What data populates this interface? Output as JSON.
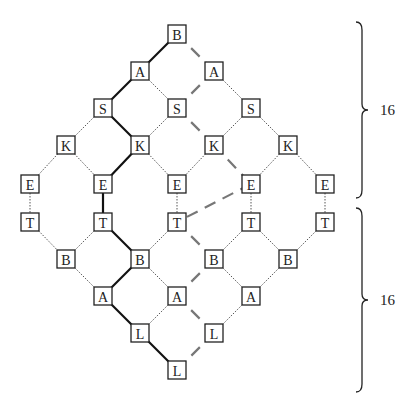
{
  "title": "",
  "node_size": 18,
  "nodes": [
    {
      "id": "n0",
      "label": "B",
      "x": 177,
      "y": 34
    },
    {
      "id": "n1",
      "label": "A",
      "x": 140,
      "y": 71
    },
    {
      "id": "n2",
      "label": "A",
      "x": 214,
      "y": 71
    },
    {
      "id": "n3",
      "label": "S",
      "x": 103,
      "y": 108
    },
    {
      "id": "n4",
      "label": "S",
      "x": 177,
      "y": 108
    },
    {
      "id": "n5",
      "label": "S",
      "x": 251,
      "y": 108
    },
    {
      "id": "n6",
      "label": "K",
      "x": 66,
      "y": 145
    },
    {
      "id": "n7",
      "label": "K",
      "x": 140,
      "y": 145
    },
    {
      "id": "n8",
      "label": "K",
      "x": 214,
      "y": 145
    },
    {
      "id": "n9",
      "label": "K",
      "x": 288,
      "y": 145
    },
    {
      "id": "n10",
      "label": "E",
      "x": 30,
      "y": 184
    },
    {
      "id": "n11",
      "label": "E",
      "x": 103,
      "y": 184
    },
    {
      "id": "n12",
      "label": "E",
      "x": 177,
      "y": 184
    },
    {
      "id": "n13",
      "label": "E",
      "x": 251,
      "y": 184
    },
    {
      "id": "n14",
      "label": "E",
      "x": 325,
      "y": 184
    },
    {
      "id": "n15",
      "label": "T",
      "x": 30,
      "y": 222
    },
    {
      "id": "n16",
      "label": "T",
      "x": 103,
      "y": 222
    },
    {
      "id": "n17",
      "label": "T",
      "x": 177,
      "y": 222
    },
    {
      "id": "n18",
      "label": "T",
      "x": 251,
      "y": 222
    },
    {
      "id": "n19",
      "label": "T",
      "x": 325,
      "y": 222
    },
    {
      "id": "n20",
      "label": "B",
      "x": 66,
      "y": 259
    },
    {
      "id": "n21",
      "label": "B",
      "x": 140,
      "y": 259
    },
    {
      "id": "n22",
      "label": "B",
      "x": 214,
      "y": 259
    },
    {
      "id": "n23",
      "label": "B",
      "x": 288,
      "y": 259
    },
    {
      "id": "n24",
      "label": "A",
      "x": 103,
      "y": 296
    },
    {
      "id": "n25",
      "label": "A",
      "x": 177,
      "y": 296
    },
    {
      "id": "n26",
      "label": "A",
      "x": 251,
      "y": 296
    },
    {
      "id": "n27",
      "label": "L",
      "x": 140,
      "y": 333
    },
    {
      "id": "n28",
      "label": "L",
      "x": 214,
      "y": 333
    },
    {
      "id": "n29",
      "label": "L",
      "x": 177,
      "y": 370
    }
  ],
  "edges": [
    {
      "from": "n0",
      "to": "n1",
      "style": "bold"
    },
    {
      "from": "n0",
      "to": "n2",
      "style": "dashed"
    },
    {
      "from": "n1",
      "to": "n3",
      "style": "bold"
    },
    {
      "from": "n1",
      "to": "n4",
      "style": "dotted"
    },
    {
      "from": "n2",
      "to": "n4",
      "style": "dashed"
    },
    {
      "from": "n2",
      "to": "n5",
      "style": "dotted"
    },
    {
      "from": "n3",
      "to": "n6",
      "style": "dotted"
    },
    {
      "from": "n3",
      "to": "n7",
      "style": "bold"
    },
    {
      "from": "n4",
      "to": "n7",
      "style": "dotted"
    },
    {
      "from": "n4",
      "to": "n8",
      "style": "dashed"
    },
    {
      "from": "n5",
      "to": "n8",
      "style": "dotted"
    },
    {
      "from": "n5",
      "to": "n9",
      "style": "dotted"
    },
    {
      "from": "n6",
      "to": "n10",
      "style": "dotted"
    },
    {
      "from": "n6",
      "to": "n11",
      "style": "dotted"
    },
    {
      "from": "n7",
      "to": "n11",
      "style": "bold"
    },
    {
      "from": "n7",
      "to": "n12",
      "style": "dotted"
    },
    {
      "from": "n8",
      "to": "n12",
      "style": "dotted"
    },
    {
      "from": "n8",
      "to": "n13",
      "style": "dashed"
    },
    {
      "from": "n9",
      "to": "n13",
      "style": "dotted"
    },
    {
      "from": "n9",
      "to": "n14",
      "style": "dotted"
    },
    {
      "from": "n10",
      "to": "n15",
      "style": "dotted"
    },
    {
      "from": "n11",
      "to": "n16",
      "style": "bold"
    },
    {
      "from": "n12",
      "to": "n17",
      "style": "dotted"
    },
    {
      "from": "n13",
      "to": "n18",
      "style": "dotted"
    },
    {
      "from": "n14",
      "to": "n19",
      "style": "dotted"
    },
    {
      "from": "n13",
      "to": "n17",
      "style": "dashed"
    },
    {
      "from": "n15",
      "to": "n20",
      "style": "dotted"
    },
    {
      "from": "n16",
      "to": "n20",
      "style": "dotted"
    },
    {
      "from": "n16",
      "to": "n21",
      "style": "bold"
    },
    {
      "from": "n17",
      "to": "n21",
      "style": "dotted"
    },
    {
      "from": "n17",
      "to": "n22",
      "style": "dashed"
    },
    {
      "from": "n18",
      "to": "n22",
      "style": "dotted"
    },
    {
      "from": "n18",
      "to": "n23",
      "style": "dotted"
    },
    {
      "from": "n19",
      "to": "n23",
      "style": "dotted"
    },
    {
      "from": "n20",
      "to": "n24",
      "style": "dotted"
    },
    {
      "from": "n21",
      "to": "n24",
      "style": "bold"
    },
    {
      "from": "n21",
      "to": "n25",
      "style": "dotted"
    },
    {
      "from": "n22",
      "to": "n25",
      "style": "dashed"
    },
    {
      "from": "n22",
      "to": "n26",
      "style": "dotted"
    },
    {
      "from": "n23",
      "to": "n26",
      "style": "dotted"
    },
    {
      "from": "n24",
      "to": "n27",
      "style": "bold"
    },
    {
      "from": "n25",
      "to": "n27",
      "style": "dotted"
    },
    {
      "from": "n25",
      "to": "n28",
      "style": "dashed"
    },
    {
      "from": "n26",
      "to": "n28",
      "style": "dotted"
    },
    {
      "from": "n27",
      "to": "n29",
      "style": "bold"
    },
    {
      "from": "n28",
      "to": "n29",
      "style": "dashed"
    }
  ],
  "braces": [
    {
      "label": "16",
      "x": 362,
      "y_top": 22,
      "y_bottom": 198,
      "label_x": 380
    },
    {
      "label": "16",
      "x": 362,
      "y_top": 208,
      "y_bottom": 392,
      "label_x": 380
    }
  ]
}
